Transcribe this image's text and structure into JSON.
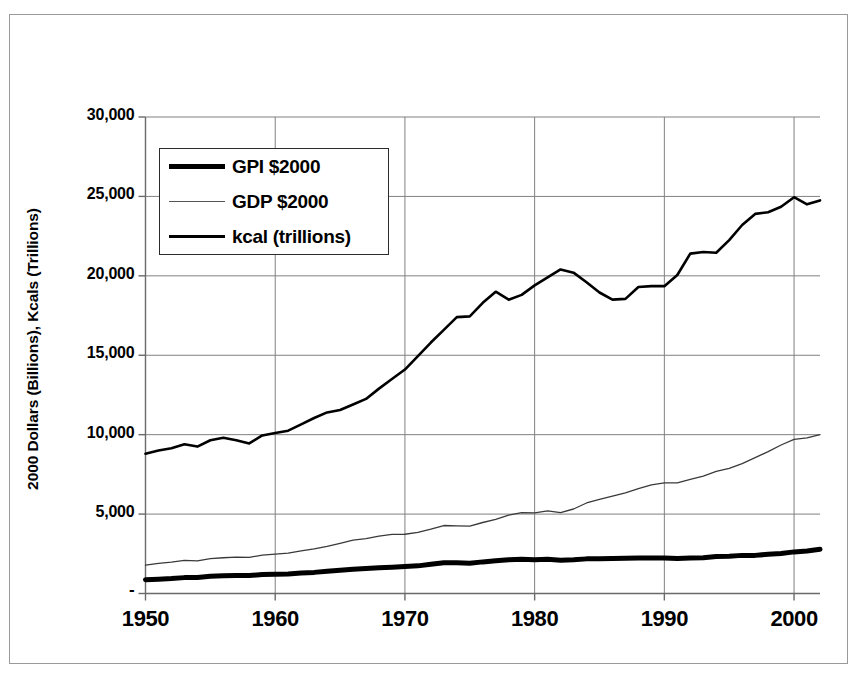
{
  "chart_data": {
    "type": "line",
    "title": "",
    "xlabel": "",
    "ylabel": "2000 Dollars (Billions), Kcals (Trillions)",
    "xlim": [
      1950,
      2002
    ],
    "ylim": [
      0,
      30000
    ],
    "grid": true,
    "legend_position": "upper-left-inside",
    "x_ticks": [
      "1950",
      "1960",
      "1970",
      "1980",
      "1990",
      "2000"
    ],
    "x_tick_values": [
      1950,
      1960,
      1970,
      1980,
      1990,
      2000
    ],
    "y_ticks": [
      "-",
      "5,000",
      "10,000",
      "15,000",
      "20,000",
      "25,000",
      "30,000"
    ],
    "y_tick_values": [
      0,
      5000,
      10000,
      15000,
      20000,
      25000,
      30000
    ],
    "x": [
      1950,
      1951,
      1952,
      1953,
      1954,
      1955,
      1956,
      1957,
      1958,
      1959,
      1960,
      1961,
      1962,
      1963,
      1964,
      1965,
      1966,
      1967,
      1968,
      1969,
      1970,
      1971,
      1972,
      1973,
      1974,
      1975,
      1976,
      1977,
      1978,
      1979,
      1980,
      1981,
      1982,
      1983,
      1984,
      1985,
      1986,
      1987,
      1988,
      1989,
      1990,
      1991,
      1992,
      1993,
      1994,
      1995,
      1996,
      1997,
      1998,
      1999,
      2000,
      2001,
      2002
    ],
    "series": [
      {
        "name": "GPI $2000",
        "style": "thick",
        "color": "#000000",
        "linewidth": 5,
        "values": [
          870,
          900,
          940,
          1000,
          1010,
          1080,
          1110,
          1130,
          1130,
          1190,
          1210,
          1230,
          1290,
          1330,
          1400,
          1470,
          1530,
          1570,
          1620,
          1660,
          1700,
          1740,
          1840,
          1930,
          1930,
          1900,
          1990,
          2060,
          2130,
          2150,
          2120,
          2150,
          2100,
          2120,
          2180,
          2190,
          2200,
          2220,
          2240,
          2240,
          2230,
          2200,
          2230,
          2250,
          2330,
          2340,
          2400,
          2400,
          2470,
          2520,
          2620,
          2680,
          2780
        ]
      },
      {
        "name": "GDP $2000",
        "style": "thin",
        "color": "#3a3a3a",
        "linewidth": 1.3,
        "values": [
          1780,
          1900,
          1980,
          2080,
          2060,
          2200,
          2250,
          2290,
          2270,
          2420,
          2480,
          2540,
          2690,
          2810,
          2970,
          3160,
          3360,
          3450,
          3610,
          3720,
          3730,
          3850,
          4050,
          4280,
          4260,
          4240,
          4470,
          4670,
          4930,
          5090,
          5080,
          5200,
          5090,
          5320,
          5700,
          5930,
          6130,
          6340,
          6600,
          6840,
          6970,
          6960,
          7190,
          7390,
          7690,
          7880,
          8180,
          8550,
          8930,
          9350,
          9700,
          9800,
          10000
        ]
      },
      {
        "name": "kcal (trillions)",
        "style": "medium",
        "color": "#000000",
        "linewidth": 2.6,
        "values": [
          8800,
          9000,
          9150,
          9400,
          9250,
          9650,
          9800,
          9650,
          9450,
          9950,
          10100,
          10250,
          10650,
          11050,
          11400,
          11550,
          11900,
          12250,
          12900,
          13500,
          14100,
          14950,
          15800,
          16600,
          17400,
          17450,
          18300,
          19000,
          18500,
          18800,
          19400,
          19900,
          20400,
          20200,
          19600,
          18950,
          18500,
          18550,
          19300,
          19350,
          19350,
          20050,
          21400,
          21500,
          21450,
          22250,
          23200,
          23900,
          24000,
          24350,
          24950,
          24500,
          24750
        ]
      }
    ]
  },
  "legend": {
    "items": [
      {
        "label": "GPI $2000",
        "style": "thick"
      },
      {
        "label": "GDP $2000",
        "style": "thin"
      },
      {
        "label": "kcal (trillions)",
        "style": "medium"
      }
    ]
  },
  "axes": {
    "y_title": "2000 Dollars (Billions), Kcals (Trillions)"
  }
}
